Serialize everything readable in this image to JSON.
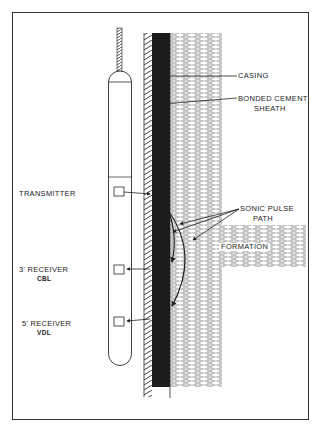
{
  "diagram": {
    "colors": {
      "line": "#2a2a2a",
      "cement": "#1a1a1a",
      "formation_dash": "#555555",
      "background": "#ffffff"
    },
    "components": {
      "tool": "logging sonde",
      "cable": "wireline cable",
      "casing": "steel casing (hatched)",
      "cement": "bonded cement sheath (solid dark)",
      "formation": "shale formation (dashed texture)"
    },
    "labels": {
      "casing": "CASING",
      "cement_line1": "BONDED CEMENT",
      "cement_line2": "SHEATH",
      "sonic_line1": "SONIC PULSE",
      "sonic_line2": "PATH",
      "formation": "FORMATION",
      "transmitter": "TRANSMITTER",
      "receiver3": "3' RECEIVER",
      "receiver3_sub": "CBL",
      "receiver5": "5' RECEIVER",
      "receiver5_sub": "VDL"
    }
  }
}
